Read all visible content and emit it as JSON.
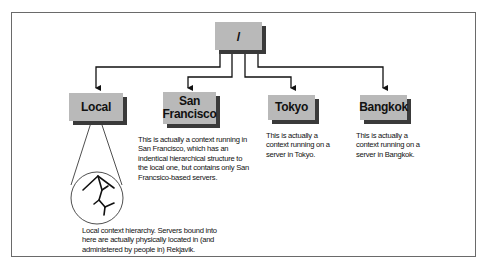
{
  "diagram": {
    "root": {
      "label": "/"
    },
    "children": [
      {
        "label": "Local",
        "description": ""
      },
      {
        "label": "San Francisco",
        "label_lines": [
          "San",
          "Francisco"
        ],
        "description": "This is actually a context running in San Francisco, which has an indentical hierarchical structure to the local one, but contains only San Francsico-based servers."
      },
      {
        "label": "Tokyo",
        "description": "This is actually a context running on a server in Tokyo."
      },
      {
        "label": "Bangkok",
        "description": "This is actually a context running on a server in Bangkok."
      }
    ],
    "local_hierarchy": {
      "icon": "tree-hierarchy-icon",
      "description": "Local context hierarchy. Servers bound into here are actually physically located in (and administered by people in) Rekjavik."
    },
    "colors": {
      "box": "#b9b9b9",
      "shadow": "#3a3a3a",
      "line": "#111111",
      "frame": "#6a6a6a"
    }
  }
}
